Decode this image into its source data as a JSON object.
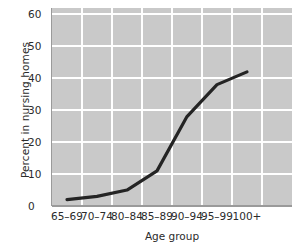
{
  "chart_data": {
    "type": "line",
    "title": "",
    "subtitle": "",
    "xlabel": "Age group",
    "ylabel": "Percent in nursing homes",
    "categories": [
      "65–69",
      "70–74",
      "80–84",
      "85–89",
      "90–94",
      "95–99",
      "100+"
    ],
    "series": [
      {
        "name": "Percent in nursing homes",
        "values": [
          2,
          3,
          5,
          11,
          28,
          38,
          42
        ],
        "color": "#242424"
      }
    ],
    "ylim": [
      0,
      62
    ],
    "yticks": [
      0,
      10,
      20,
      30,
      40,
      50,
      60
    ],
    "ytick_labels": [
      "0",
      "10",
      "20",
      "30",
      "40",
      "50",
      "60"
    ],
    "xlim_padding_right": 0.18,
    "grid": true,
    "grid_color": "#ffffff",
    "plot_background": "#c9c9c9",
    "legend": "none",
    "legend_position": "none",
    "line_width": 3.2
  },
  "axes": {
    "y_title": "Percent in nursing homes",
    "x_title": "Age group"
  }
}
